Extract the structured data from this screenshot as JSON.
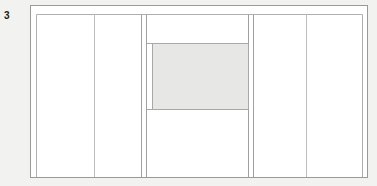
{
  "figure": {
    "label": "3",
    "type": "architectural-elevation-line-drawing"
  },
  "canvas": {
    "width": 377,
    "height": 186,
    "background_color": "#f2f2f0"
  },
  "colors": {
    "background": "#f2f2f0",
    "paper": "#ffffff",
    "outline_dark": "#909090",
    "outline_light": "#b8b8b8",
    "outline_faint": "#cfcfcf",
    "shaded_panel_fill": "#e7e7e5",
    "shaded_panel_stroke": "#a8a8a8",
    "label_text": "#1a1a1a"
  },
  "frame": {
    "outer": {
      "x": 30,
      "y": 5,
      "width": 338,
      "height": 173
    },
    "inner_offset_left_x": 36,
    "inner_offset_right_x": 363,
    "inner_top_y": 14,
    "bottom_y": 178
  },
  "vertical_dividers": [
    {
      "name": "left-outer-edge",
      "x": 30
    },
    {
      "name": "left-inner-jamb",
      "x": 36
    },
    {
      "name": "bay-1-right",
      "x": 94
    },
    {
      "name": "bay-2-right",
      "x": 141
    },
    {
      "name": "center-bay-left-jamb",
      "x": 146
    },
    {
      "name": "center-bay-right-jamb",
      "x": 248
    },
    {
      "name": "bay-4-left",
      "x": 253
    },
    {
      "name": "bay-4-right",
      "x": 306
    },
    {
      "name": "right-inner-jamb",
      "x": 363
    },
    {
      "name": "right-outer-edge",
      "x": 368
    }
  ],
  "horizontal_lines": [
    {
      "name": "outer-top-rail",
      "y": 5,
      "x1": 30,
      "x2": 368
    },
    {
      "name": "inner-head-rail",
      "y": 14,
      "x1": 36,
      "x2": 363
    },
    {
      "name": "base-rail",
      "y": 178,
      "x1": 30,
      "x2": 368
    }
  ],
  "bays": [
    {
      "name": "bay-left-margin",
      "x": 30,
      "width": 6
    },
    {
      "name": "bay-1",
      "x": 36,
      "width": 58
    },
    {
      "name": "bay-2",
      "x": 94,
      "width": 47
    },
    {
      "name": "bay-mullion-left",
      "x": 141,
      "width": 5
    },
    {
      "name": "bay-center",
      "x": 146,
      "width": 102
    },
    {
      "name": "bay-mullion-right",
      "x": 248,
      "width": 5
    },
    {
      "name": "bay-4",
      "x": 253,
      "width": 53
    },
    {
      "name": "bay-5",
      "x": 306,
      "width": 57
    },
    {
      "name": "bay-right-margin",
      "x": 363,
      "width": 5
    }
  ],
  "shaded_panel": {
    "name": "center-glazed-panel",
    "x": 152,
    "y": 43,
    "width": 97,
    "height": 67,
    "fill": "#e7e7e5",
    "stroke": "#a8a8a8",
    "top_rail_y": 43,
    "bottom_rail_y": 110
  }
}
